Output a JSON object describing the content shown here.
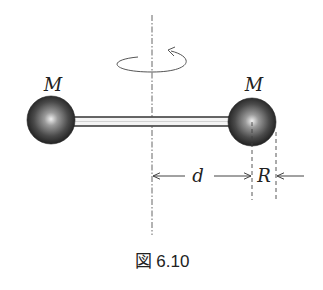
{
  "figure": {
    "caption": "図 6.10",
    "labels": {
      "left_mass": "M",
      "right_mass": "M",
      "distance": "d",
      "radius": "R"
    },
    "colors": {
      "line": "#444444",
      "sphere_dark": "#1a1a1a",
      "sphere_light": "#e8e8e8",
      "rod_fill": "#f2f2f2"
    }
  }
}
